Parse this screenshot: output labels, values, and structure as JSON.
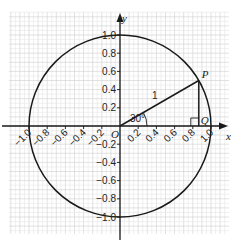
{
  "diagram": {
    "axes": {
      "x_label": "x",
      "y_label": "y",
      "origin_label": "O",
      "range": [
        -1.0,
        1.0
      ],
      "x_ticks": [
        {
          "value": -1.0,
          "label": "−1.0"
        },
        {
          "value": -0.8,
          "label": "−0.8"
        },
        {
          "value": -0.6,
          "label": "−0.6"
        },
        {
          "value": -0.4,
          "label": "−0.4"
        },
        {
          "value": -0.2,
          "label": "−0.2"
        },
        {
          "value": 0.2,
          "label": "0.2"
        },
        {
          "value": 0.4,
          "label": "0.4"
        },
        {
          "value": 0.6,
          "label": "0.6"
        },
        {
          "value": 0.8,
          "label": "0.8"
        },
        {
          "value": 1.0,
          "label": "1.0"
        }
      ],
      "y_ticks": [
        {
          "value": 1.0,
          "label": "1.0"
        },
        {
          "value": 0.8,
          "label": "0.8"
        },
        {
          "value": 0.6,
          "label": "0.6"
        },
        {
          "value": 0.4,
          "label": "0.4"
        },
        {
          "value": 0.2,
          "label": "0.2"
        },
        {
          "value": -0.2,
          "label": "−0.2"
        },
        {
          "value": -0.4,
          "label": "−0.4"
        },
        {
          "value": -0.6,
          "label": "−0.6"
        },
        {
          "value": -0.8,
          "label": "−0.8"
        },
        {
          "value": -1.0,
          "label": "−1.0"
        }
      ]
    },
    "circle": {
      "center": [
        0,
        0
      ],
      "radius": 1
    },
    "angle_degrees": 30,
    "angle_label": "30°",
    "hypotenuse_label": "1",
    "points": {
      "P": {
        "label": "P",
        "x": 0.866,
        "y": 0.5
      },
      "Q": {
        "label": "Q",
        "x": 0.866,
        "y": 0
      }
    },
    "grid": {
      "minor_step": 0.05,
      "major_step": 0.1,
      "extent": [
        -1.2,
        1.2
      ]
    },
    "colors": {
      "line": "#1a1a1a",
      "grid_minor": "#e6e6e6",
      "grid_major": "#cfcfcf",
      "text": "#222222"
    }
  }
}
